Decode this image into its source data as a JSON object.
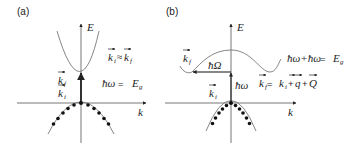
{
  "panels": [
    {
      "id": "a",
      "label": "(a)",
      "axis_e": "E",
      "axis_k": "k",
      "kf": "k",
      "kf_sub": "f",
      "ki": "k",
      "ki_sub": "i",
      "relation_k_left": "k",
      "relation_k_left_sub": "i",
      "relation_op": "≈",
      "relation_k_right": "k",
      "relation_k_right_sub": "f",
      "energy_lhs": "ħω",
      "energy_eq": " = ",
      "energy_rhs": "E",
      "energy_rhs_sub": "g"
    },
    {
      "id": "b",
      "label": "(b)",
      "axis_e": "E",
      "axis_k": "k",
      "kf": "k",
      "kf_sub": "f",
      "ki": "k",
      "ki_sub": "i",
      "phonon": "ħΩ",
      "photon": "ħω",
      "energy_lhs": "ħω+ħω",
      "energy_eq": " = ",
      "energy_rhs": "E",
      "energy_rhs_sub": "g",
      "momentum_k1": "k",
      "momentum_k1_sub": "f",
      "momentum_eq": " = ",
      "momentum_k2": "k",
      "momentum_k2_sub": "i",
      "momentum_plus1": "+",
      "momentum_q": "q",
      "momentum_plus2": "+",
      "momentum_Q": "Q"
    }
  ],
  "colors": {
    "axis": "#555555",
    "curve": "#777777",
    "dots": "#111111",
    "arrow": "#111111"
  }
}
